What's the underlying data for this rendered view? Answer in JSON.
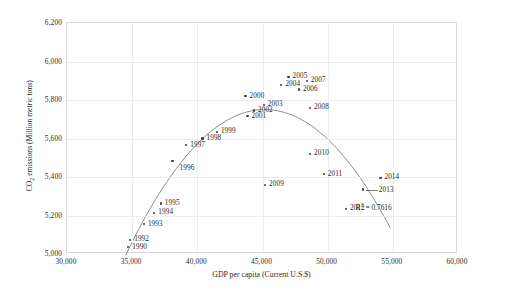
{
  "chart_data": {
    "type": "scatter",
    "title": "",
    "xlabel": "GDP per capita (Current U.S.$)",
    "ylabel_parts": {
      "prefix": "CO",
      "subscript": "2",
      "suffix": " emissions (Million metric tons)"
    },
    "ylabel": "CO2 emissions (Million metric tons)",
    "xlim": [
      30000,
      60000
    ],
    "ylim": [
      5000,
      6200
    ],
    "xticks": [
      "30,000",
      "35,000",
      "40,000",
      "45,000",
      "50,000",
      "55,000",
      "60,000"
    ],
    "xtick_values": [
      30000,
      35000,
      40000,
      45000,
      50000,
      55000,
      60000
    ],
    "yticks": [
      "5,000",
      "5,200",
      "5,400",
      "5,600",
      "5,800",
      "6,000",
      "6,200"
    ],
    "ytick_values": [
      5000,
      5200,
      5400,
      5600,
      5800,
      6000,
      6200
    ],
    "grid": true,
    "legend": "none",
    "annotations": [
      {
        "name": "r-squared",
        "text_prefix": "R",
        "text_superscript": "2",
        "text_suffix": " = 0.7616",
        "text": "R² = 0.7616",
        "x": 54000,
        "y": 5245
      }
    ],
    "trendline": {
      "type": "quadratic",
      "visible": true,
      "color": "#808080",
      "x_start": 34500,
      "x_end": 54800
    },
    "point_color": "#3b3b3b",
    "points": [
      {
        "label": "1990",
        "x": 34700,
        "y": 5035,
        "label_pos": "right"
      },
      {
        "label": "1992",
        "x": 34850,
        "y": 5073,
        "label_pos": "right"
      },
      {
        "label": "1993",
        "x": 35900,
        "y": 5155,
        "label_pos": "right"
      },
      {
        "label": "1994",
        "x": 36700,
        "y": 5215,
        "label_pos": "right"
      },
      {
        "label": "1995",
        "x": 37200,
        "y": 5262,
        "label_pos": "right"
      },
      {
        "label": "1996",
        "x": 38100,
        "y": 5485,
        "label_pos": "below-right"
      },
      {
        "label": "1997",
        "x": 39150,
        "y": 5565,
        "label_pos": "right"
      },
      {
        "label": "1998",
        "x": 40400,
        "y": 5600,
        "label_pos": "right"
      },
      {
        "label": "1999",
        "x": 41500,
        "y": 5635,
        "label_pos": "right"
      },
      {
        "label": "2000",
        "x": 43700,
        "y": 5820,
        "label_pos": "right"
      },
      {
        "label": "2001",
        "x": 43850,
        "y": 5715,
        "label_pos": "right"
      },
      {
        "label": "2002",
        "x": 44350,
        "y": 5745,
        "label_pos": "right"
      },
      {
        "label": "2003",
        "x": 45100,
        "y": 5775,
        "label_pos": "right"
      },
      {
        "label": "2004",
        "x": 46450,
        "y": 5880,
        "label_pos": "right"
      },
      {
        "label": "2005",
        "x": 47000,
        "y": 5920,
        "label_pos": "right"
      },
      {
        "label": "2006",
        "x": 47800,
        "y": 5855,
        "label_pos": "right"
      },
      {
        "label": "2007",
        "x": 48400,
        "y": 5900,
        "label_pos": "right"
      },
      {
        "label": "2008",
        "x": 48650,
        "y": 5760,
        "label_pos": "right"
      },
      {
        "label": "2009",
        "x": 45200,
        "y": 5360,
        "label_pos": "right"
      },
      {
        "label": "2010",
        "x": 48650,
        "y": 5520,
        "label_pos": "right"
      },
      {
        "label": "2011",
        "x": 49700,
        "y": 5415,
        "label_pos": "right"
      },
      {
        "label": "2012",
        "x": 51400,
        "y": 5235,
        "label_pos": "right"
      },
      {
        "label": "2013",
        "x": 52700,
        "y": 5335,
        "label_pos": "leader-right"
      },
      {
        "label": "2014",
        "x": 54050,
        "y": 5395,
        "label_pos": "right"
      }
    ]
  }
}
